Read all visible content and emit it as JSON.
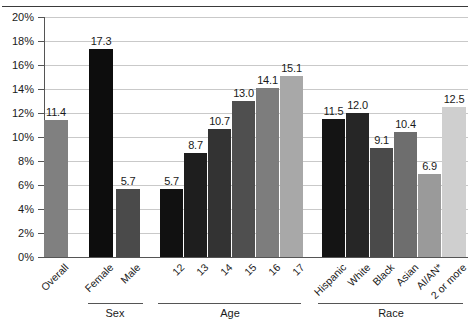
{
  "chart_data": {
    "type": "bar",
    "title": "",
    "xlabel": "",
    "ylabel": "",
    "ylim": [
      0,
      20
    ],
    "ytick_labels": [
      "0%",
      "2%",
      "4%",
      "6%",
      "8%",
      "10%",
      "12%",
      "14%",
      "16%",
      "18%",
      "20%"
    ],
    "ytick_values": [
      0,
      2,
      4,
      6,
      8,
      10,
      12,
      14,
      16,
      18,
      20
    ],
    "grid": true,
    "legend": "none",
    "value_labels": true,
    "categories": [
      "Overall",
      "Female",
      "Male",
      "12",
      "13",
      "14",
      "15",
      "16",
      "17",
      "Hispanic",
      "White",
      "Black",
      "Asian",
      "AI/AN*",
      "2 or more"
    ],
    "values": [
      11.4,
      17.3,
      5.7,
      5.7,
      8.7,
      10.7,
      13.0,
      14.1,
      15.1,
      11.5,
      12.0,
      9.1,
      10.4,
      6.9,
      12.5
    ],
    "value_labels_text": [
      "11.4",
      "17.3",
      "5.7",
      "5.7",
      "8.7",
      "10.7",
      "13.0",
      "14.1",
      "15.1",
      "11.5",
      "12.0",
      "9.1",
      "10.4",
      "6.9",
      "12.5"
    ],
    "bar_colors": [
      "#808080",
      "#0d0d0d",
      "#4a4a4a",
      "#111111",
      "#1e1e1e",
      "#333333",
      "#4f4f4f",
      "#7d7d7d",
      "#a8a8a8",
      "#141414",
      "#262626",
      "#4a4a4a",
      "#6e6e6e",
      "#9a9a9a",
      "#cfcfcf"
    ],
    "bars": [
      {
        "label": "Overall",
        "value": 11.4,
        "value_label": "11.4",
        "color": "#808080",
        "x": 44,
        "width": 24
      },
      {
        "label": "Female",
        "value": 17.3,
        "value_label": "17.3",
        "color": "#0d0d0d",
        "x": 89,
        "width": 24
      },
      {
        "label": "Male",
        "value": 5.7,
        "value_label": "5.7",
        "color": "#4a4a4a",
        "x": 116,
        "width": 24
      },
      {
        "label": "12",
        "value": 5.7,
        "value_label": "5.7",
        "color": "#111111",
        "x": 160,
        "width": 23
      },
      {
        "label": "13",
        "value": 8.7,
        "value_label": "8.7",
        "color": "#1e1e1e",
        "x": 184,
        "width": 23
      },
      {
        "label": "14",
        "value": 10.7,
        "value_label": "10.7",
        "color": "#333333",
        "x": 208,
        "width": 23
      },
      {
        "label": "15",
        "value": 13.0,
        "value_label": "13.0",
        "color": "#4f4f4f",
        "x": 232,
        "width": 23
      },
      {
        "label": "16",
        "value": 14.1,
        "value_label": "14.1",
        "color": "#7d7d7d",
        "x": 256,
        "width": 23
      },
      {
        "label": "17",
        "value": 15.1,
        "value_label": "15.1",
        "color": "#a8a8a8",
        "x": 280,
        "width": 23
      },
      {
        "label": "Hispanic",
        "value": 11.5,
        "value_label": "11.5",
        "color": "#141414",
        "x": 322,
        "width": 23
      },
      {
        "label": "White",
        "value": 12.0,
        "value_label": "12.0",
        "color": "#262626",
        "x": 346,
        "width": 23
      },
      {
        "label": "Black",
        "value": 9.1,
        "value_label": "9.1",
        "color": "#4a4a4a",
        "x": 370,
        "width": 23
      },
      {
        "label": "Asian",
        "value": 10.4,
        "value_label": "10.4",
        "color": "#6e6e6e",
        "x": 394,
        "width": 23
      },
      {
        "label": "AI/AN*",
        "value": 6.9,
        "value_label": "6.9",
        "color": "#9a9a9a",
        "x": 418,
        "width": 23
      },
      {
        "label": "2 or more",
        "value": 12.5,
        "value_label": "12.5",
        "color": "#cfcfcf",
        "x": 442,
        "width": 24
      }
    ],
    "groups": [
      {
        "name": "Sex",
        "line_left": 88,
        "line_width": 55,
        "label_center": 115
      },
      {
        "name": "Age",
        "line_width": 143,
        "line_left": 158,
        "label_center": 230
      },
      {
        "name": "Race",
        "line_left": 318,
        "line_width": 145,
        "label_center": 391
      }
    ]
  }
}
